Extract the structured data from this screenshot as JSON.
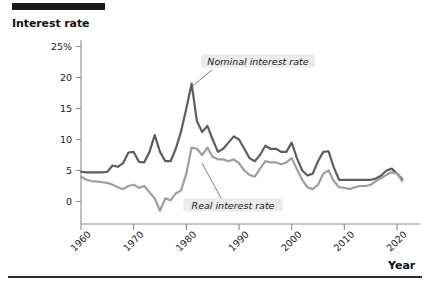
{
  "figure": {
    "y_axis_title": "Interest rate",
    "x_axis_title": "Year"
  },
  "annotations": {
    "nominal": "Nominal interest rate",
    "real": "Real interest rate"
  },
  "chart_data": {
    "type": "line",
    "title": "",
    "xlabel": "Year",
    "ylabel": "Interest rate",
    "xlim": [
      1960,
      2022
    ],
    "ylim": [
      -3,
      25
    ],
    "grid": false,
    "legend_position": "inline-annotations",
    "y_ticks": [
      "0",
      "5",
      "10",
      "15",
      "20",
      "25%"
    ],
    "y_tick_values": [
      0,
      5,
      10,
      15,
      20,
      25
    ],
    "x_ticks": [
      "1960",
      "1970",
      "1980",
      "1990",
      "2000",
      "2010",
      "2020"
    ],
    "x_tick_values": [
      1960,
      1970,
      1980,
      1990,
      2000,
      2010,
      2020
    ],
    "x": [
      1960,
      1961,
      1962,
      1963,
      1964,
      1965,
      1966,
      1967,
      1968,
      1969,
      1970,
      1971,
      1972,
      1973,
      1974,
      1975,
      1976,
      1977,
      1978,
      1979,
      1980,
      1981,
      1982,
      1983,
      1984,
      1985,
      1986,
      1987,
      1988,
      1989,
      1990,
      1991,
      1992,
      1993,
      1994,
      1995,
      1996,
      1997,
      1998,
      1999,
      2000,
      2001,
      2002,
      2003,
      2004,
      2005,
      2006,
      2007,
      2008,
      2009,
      2010,
      2011,
      2012,
      2013,
      2014,
      2015,
      2016,
      2017,
      2018,
      2019,
      2020,
      2021
    ],
    "series": [
      {
        "name": "Nominal interest rate",
        "color": "#5d5d5d",
        "values": [
          4.8,
          4.7,
          4.7,
          4.7,
          4.7,
          4.8,
          5.8,
          5.6,
          6.2,
          7.9,
          8.0,
          6.4,
          6.3,
          8.0,
          10.7,
          8.0,
          6.5,
          6.5,
          8.5,
          11.3,
          15.0,
          19.0,
          13.0,
          11.2,
          12.2,
          10.0,
          8.0,
          8.5,
          9.5,
          10.5,
          10.0,
          8.5,
          7.0,
          6.5,
          7.5,
          9.0,
          8.5,
          8.5,
          8.0,
          8.0,
          9.5,
          7.0,
          5.0,
          4.2,
          4.5,
          6.5,
          8.0,
          8.1,
          5.5,
          3.5,
          3.5,
          3.5,
          3.5,
          3.5,
          3.5,
          3.5,
          3.7,
          4.2,
          5.0,
          5.3,
          4.5,
          3.6
        ]
      },
      {
        "name": "Real interest rate",
        "color": "#9e9e9e",
        "values": [
          4.0,
          3.5,
          3.3,
          3.2,
          3.1,
          3.0,
          2.7,
          2.3,
          2.0,
          2.5,
          2.7,
          2.2,
          2.5,
          1.5,
          0.5,
          -1.5,
          0.5,
          0.2,
          1.3,
          1.8,
          4.5,
          8.7,
          8.5,
          7.5,
          8.7,
          7.2,
          6.8,
          6.8,
          6.5,
          6.8,
          6.2,
          5.0,
          4.3,
          4.0,
          5.3,
          6.5,
          6.3,
          6.3,
          6.0,
          6.3,
          7.0,
          5.2,
          3.5,
          2.3,
          2.0,
          2.7,
          4.5,
          5.0,
          3.3,
          2.3,
          2.2,
          2.0,
          2.3,
          2.5,
          2.5,
          2.7,
          3.3,
          3.8,
          4.3,
          4.7,
          4.5,
          3.3
        ]
      }
    ]
  }
}
